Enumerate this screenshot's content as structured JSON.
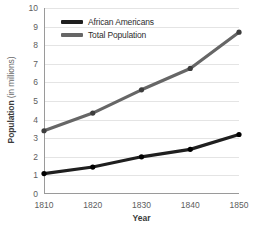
{
  "chart_data": {
    "type": "line",
    "title": "",
    "xlabel": "Year",
    "ylabel": "Population (in millions)",
    "ylabel_bold_part": "Population",
    "ylabel_light_part": "(in millions)",
    "categories": [
      "1810",
      "1820",
      "1830",
      "1840",
      "1850"
    ],
    "x": [
      1810,
      1820,
      1830,
      1840,
      1850
    ],
    "xlim": [
      1810,
      1850
    ],
    "ylim": [
      0,
      10
    ],
    "yticks": [
      "0",
      "1",
      "2",
      "3",
      "4",
      "5",
      "6",
      "7",
      "8",
      "9",
      "10"
    ],
    "ytick_values": [
      0,
      1,
      2,
      3,
      4,
      5,
      6,
      7,
      8,
      9,
      10
    ],
    "grid": true,
    "grid_axis": "y",
    "legend_position": "top-left-inside",
    "series": [
      {
        "name": "African Americans",
        "color": "#1f1f1f",
        "values": [
          1.1,
          1.45,
          2.0,
          2.4,
          3.2
        ],
        "marker": "circle"
      },
      {
        "name": "Total Population",
        "color": "#666666",
        "values": [
          3.4,
          4.35,
          5.6,
          6.75,
          8.7
        ],
        "marker": "circle"
      }
    ]
  },
  "legend": {
    "items": [
      {
        "label": "African Americans",
        "color": "#1f1f1f"
      },
      {
        "label": "Total Population",
        "color": "#666666"
      }
    ]
  },
  "axes": {
    "x_title": "Year",
    "y_title_strong": "Population",
    "y_title_light": "(in millions)"
  }
}
